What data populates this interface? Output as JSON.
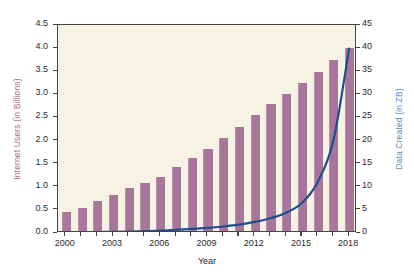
{
  "chart_data": {
    "type": "bar",
    "title": "",
    "subtitle": "",
    "xlabel": "Year",
    "ylabel": "Internet Users (in Billions)",
    "ylabel_secondary": "Data Created (in ZB)",
    "x": [
      2000,
      2001,
      2002,
      2003,
      2004,
      2005,
      2006,
      2007,
      2008,
      2009,
      2010,
      2011,
      2012,
      2013,
      2014,
      2015,
      2016,
      2017,
      2018
    ],
    "categories": [
      "2000",
      "2001",
      "2002",
      "2003",
      "2004",
      "2005",
      "2006",
      "2007",
      "2008",
      "2009",
      "2010",
      "2011",
      "2012",
      "2013",
      "2014",
      "2015",
      "2016",
      "2017",
      "2018"
    ],
    "xlim": [
      1999.5,
      2018.5
    ],
    "ylim": [
      0.0,
      4.5
    ],
    "ylim_secondary": [
      0,
      45
    ],
    "yticks": [
      "0.0",
      "0.5",
      "1.0",
      "1.5",
      "2.0",
      "2.5",
      "3.0",
      "3.5",
      "4.0",
      "4.5"
    ],
    "ytick_values": [
      0.0,
      0.5,
      1.0,
      1.5,
      2.0,
      2.5,
      3.0,
      3.5,
      4.0,
      4.5
    ],
    "yticks_secondary": [
      "0",
      "5",
      "10",
      "15",
      "20",
      "25",
      "30",
      "35",
      "40",
      "45"
    ],
    "ytick_values_secondary": [
      0,
      5,
      10,
      15,
      20,
      25,
      30,
      35,
      40,
      45
    ],
    "xticks": [
      "2000",
      "2003",
      "2006",
      "2009",
      "2012",
      "2015",
      "2018"
    ],
    "xtick_values": [
      2000,
      2003,
      2006,
      2009,
      2012,
      2015,
      2018
    ],
    "grid": false,
    "legend": false,
    "legend_position": "none",
    "series": [
      {
        "name": "Internet Users (in Billions)",
        "type": "bar",
        "axis": "left",
        "color": "#a8759b",
        "values": [
          0.41,
          0.5,
          0.66,
          0.78,
          0.92,
          1.03,
          1.17,
          1.38,
          1.58,
          1.77,
          2.02,
          2.24,
          2.5,
          2.74,
          2.96,
          3.2,
          3.44,
          3.69,
          3.95
        ]
      },
      {
        "name": "Data Created (in ZB)",
        "type": "line",
        "axis": "right",
        "color": "#1f4e8c",
        "values": [
          0.1,
          0.15,
          0.2,
          0.25,
          0.3,
          0.4,
          0.5,
          0.7,
          0.9,
          1.1,
          1.4,
          1.8,
          2.4,
          3.2,
          4.4,
          6.5,
          11.0,
          20.0,
          39.9
        ]
      }
    ]
  },
  "axes": {
    "left_label": "Internet Users (in Billions)",
    "right_label": "Data Created (in ZB)",
    "x_label": "Year"
  },
  "colors": {
    "bar": "#a8759b",
    "line": "#1f4e8c",
    "plot_background": "#f6f3e4",
    "left_axis_text": "#b06a8f",
    "right_axis_text": "#5b8cc0",
    "frame": "#45443f"
  }
}
